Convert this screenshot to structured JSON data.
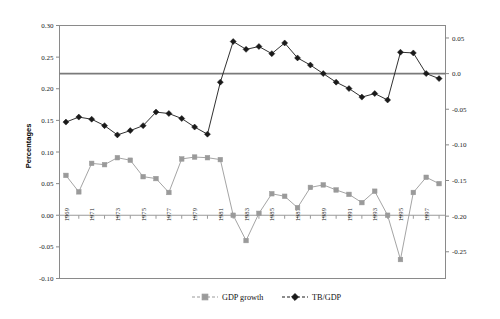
{
  "chart_data": {
    "type": "line",
    "title": "",
    "subtitle": "",
    "xlabel": "",
    "ylabel": "Percentages",
    "ylabel_right": "",
    "grid": false,
    "legend_position": "bottom",
    "x": [
      1969,
      1970,
      1971,
      1972,
      1973,
      1974,
      1975,
      1976,
      1977,
      1978,
      1979,
      1980,
      1981,
      1982,
      1983,
      1984,
      1985,
      1986,
      1987,
      1988,
      1989,
      1990,
      1991,
      1992,
      1993,
      1994,
      1995,
      1996,
      1997,
      1998
    ],
    "xtick_labels": [
      "1969",
      "1971",
      "1973",
      "1975",
      "1977",
      "1979",
      "1981",
      "1983",
      "1985",
      "1987",
      "1989",
      "1991",
      "1993",
      "1995",
      "1997"
    ],
    "xlim": [
      1968.5,
      1998.5
    ],
    "ylim": [
      -0.1,
      0.3
    ],
    "ytick_labels": [
      "0.30",
      "0.25",
      "0.20",
      "0.15",
      "0.10",
      "0.05",
      "0.00",
      "-0.05",
      "-0.10"
    ],
    "ytick_values": [
      0.3,
      0.25,
      0.2,
      0.15,
      0.1,
      0.05,
      0.0,
      -0.05,
      -0.1
    ],
    "ylim_right": [
      -0.2875,
      0.0675
    ],
    "ytick_labels_right": [
      "0.05",
      "0.0",
      "-0.05",
      "-0.10",
      "-0.15",
      "-0.20",
      "-0.25"
    ],
    "ytick_values_right": [
      0.05,
      0.0,
      -0.05,
      -0.1,
      -0.15,
      -0.2,
      -0.25
    ],
    "zero_reference_line": 0.0,
    "series": [
      {
        "name": "GDP growth",
        "axis": "left",
        "marker": "square",
        "color": "#9a9a9a",
        "values": [
          0.063,
          0.037,
          0.082,
          0.08,
          0.091,
          0.087,
          0.061,
          0.058,
          0.036,
          0.089,
          0.092,
          0.091,
          0.088,
          0.0,
          -0.04,
          0.003,
          0.034,
          0.03,
          0.012,
          0.044,
          0.048,
          0.04,
          0.033,
          0.02,
          0.038,
          0.0,
          -0.07,
          0.036,
          0.06,
          0.05
        ]
      },
      {
        "name": "TB/GDP",
        "axis": "right",
        "marker": "diamond",
        "color": "#1a1a1a",
        "values": [
          -0.068,
          -0.061,
          -0.064,
          -0.073,
          -0.086,
          -0.08,
          -0.073,
          -0.054,
          -0.056,
          -0.063,
          -0.075,
          -0.085,
          -0.012,
          0.045,
          0.034,
          0.038,
          0.028,
          0.043,
          0.022,
          0.012,
          0.0,
          -0.012,
          -0.021,
          -0.033,
          -0.028,
          -0.037,
          0.03,
          0.029,
          0.0,
          -0.007
        ]
      }
    ]
  },
  "legend": {
    "items": [
      {
        "label": "GDP growth",
        "marker": "square",
        "color": "#9a9a9a"
      },
      {
        "label": "TB/GDP",
        "marker": "diamond",
        "color": "#1a1a1a"
      }
    ]
  },
  "axes": {
    "y_left_title": "Percentages"
  }
}
